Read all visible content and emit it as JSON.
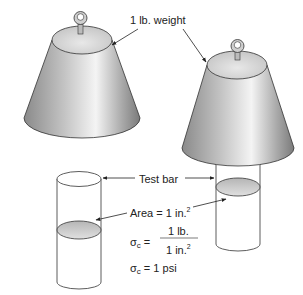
{
  "labels": {
    "weight": "1 lb. weight",
    "test_bar": "Test bar",
    "area_prefix": "Area = 1 in.",
    "area_exp": "2",
    "sigma": "σ",
    "sigma_sub": "c",
    "equals": "=",
    "numerator": "1 lb.",
    "denominator": "1 in.",
    "denominator_exp": "2",
    "result": "= 1 psi"
  },
  "colors": {
    "stroke": "#333333",
    "cone_dark": "#8a8a8a",
    "cone_light": "#f2f2f2",
    "top_face": "#dcdcdc",
    "section_fill": "#c8c8c8"
  }
}
